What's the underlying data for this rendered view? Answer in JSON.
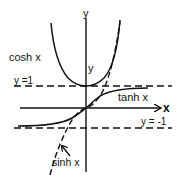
{
  "diagram": {
    "axes": {
      "x_label": "x",
      "y_label": "y"
    },
    "curves": [
      {
        "name": "cosh",
        "label": "cosh x",
        "style": "solid"
      },
      {
        "name": "tanh",
        "label": "tanh x",
        "style": "solid"
      },
      {
        "name": "sinh",
        "label": "sinh x",
        "style": "dashed"
      }
    ],
    "asymptotes": [
      {
        "label": "y =1",
        "value": 1,
        "style": "dashed"
      },
      {
        "label": "y = -1",
        "value": -1,
        "style": "dashed"
      }
    ],
    "inner_y_label": "y",
    "colors": {
      "ink": "#111111",
      "background": "#ffffff"
    }
  }
}
